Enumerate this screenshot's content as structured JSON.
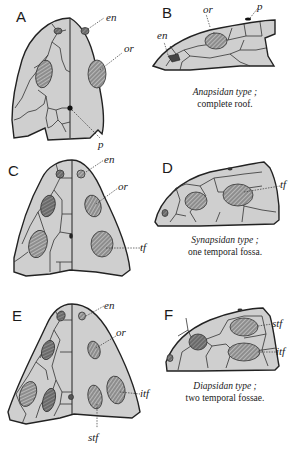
{
  "figure": {
    "panels": [
      {
        "id": "A",
        "letter": "A",
        "view": "dorsal",
        "labels": {
          "en": "en",
          "or": "or",
          "p": "p"
        }
      },
      {
        "id": "B",
        "letter": "B",
        "view": "lateral",
        "labels": {
          "or": "or",
          "p": "p",
          "en": "en"
        },
        "caption_title": "Anapsidan type ;",
        "caption_sub": "complete roof."
      },
      {
        "id": "C",
        "letter": "C",
        "view": "dorsal",
        "labels": {
          "en": "en",
          "or": "or",
          "tf": "tf"
        }
      },
      {
        "id": "D",
        "letter": "D",
        "view": "lateral",
        "labels": {
          "tf": "tf"
        },
        "caption_title": "Synapsidan type ;",
        "caption_sub": "one temporal fossa."
      },
      {
        "id": "E",
        "letter": "E",
        "view": "dorsal",
        "labels": {
          "en": "en",
          "or": "or",
          "itf": "itf",
          "stf": "stf"
        }
      },
      {
        "id": "F",
        "letter": "F",
        "view": "lateral",
        "labels": {
          "stf": "stf",
          "itf": "itf"
        },
        "caption_title": "Diapsidan type ;",
        "caption_sub": "two temporal fossae."
      }
    ],
    "colors": {
      "bone": "#cfcfcf",
      "outline": "#222222",
      "fenestra": "#8a8a8a",
      "background": "#ffffff"
    }
  }
}
